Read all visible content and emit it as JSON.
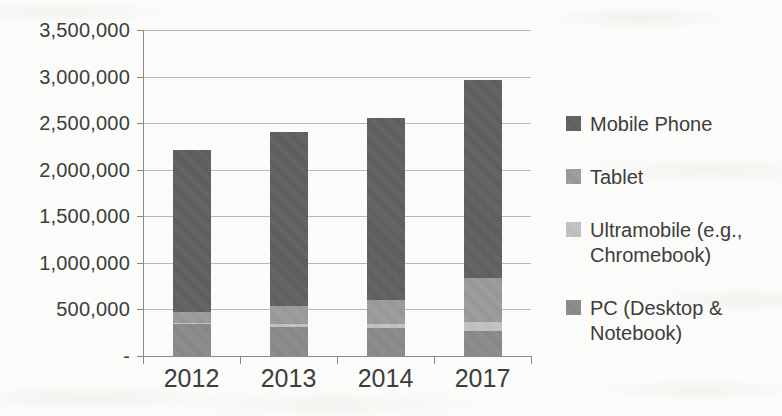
{
  "chart_data": {
    "type": "bar",
    "stacked": true,
    "title": "",
    "xlabel": "",
    "ylabel": "",
    "categories": [
      "2012",
      "2013",
      "2014",
      "2017"
    ],
    "series": [
      {
        "name": "PC (Desktop & Notebook)",
        "color": "#8a8a8a",
        "values": [
          340000,
          315000,
          300000,
          270000
        ]
      },
      {
        "name": "Ultramobile (e.g., Chromebook)",
        "color": "#c4c4c4",
        "values": [
          10000,
          25000,
          40000,
          95000
        ]
      },
      {
        "name": "Tablet",
        "color": "#9b9b9b",
        "values": [
          120000,
          195000,
          265000,
          470000
        ]
      },
      {
        "name": "Mobile Phone",
        "color": "#5f5f5f",
        "values": [
          1745000,
          1875000,
          1950000,
          2130000
        ]
      }
    ],
    "stack_order": "bottom to top: PC, Ultramobile, Tablet, Mobile Phone",
    "ylim": [
      0,
      3500000
    ],
    "grid": true,
    "yticks": [
      {
        "value": 3500000,
        "label": "3,500,000"
      },
      {
        "value": 3000000,
        "label": "3,000,000"
      },
      {
        "value": 2500000,
        "label": "2,500,000"
      },
      {
        "value": 2000000,
        "label": "2,000,000"
      },
      {
        "value": 1500000,
        "label": "1,500,000"
      },
      {
        "value": 1000000,
        "label": "1,000,000"
      },
      {
        "value": 500000,
        "label": "500,000"
      },
      {
        "value": 0,
        "label": "-"
      }
    ],
    "legend": {
      "position": "right",
      "items": [
        {
          "label": "Mobile Phone",
          "color": "#5f5f5f"
        },
        {
          "label": "Tablet",
          "color": "#9b9b9b"
        },
        {
          "label": "Ultramobile (e.g.,\nChromebook)",
          "color": "#c4c4c4"
        },
        {
          "label": "PC (Desktop &\nNotebook)",
          "color": "#8a8a8a"
        }
      ]
    }
  }
}
